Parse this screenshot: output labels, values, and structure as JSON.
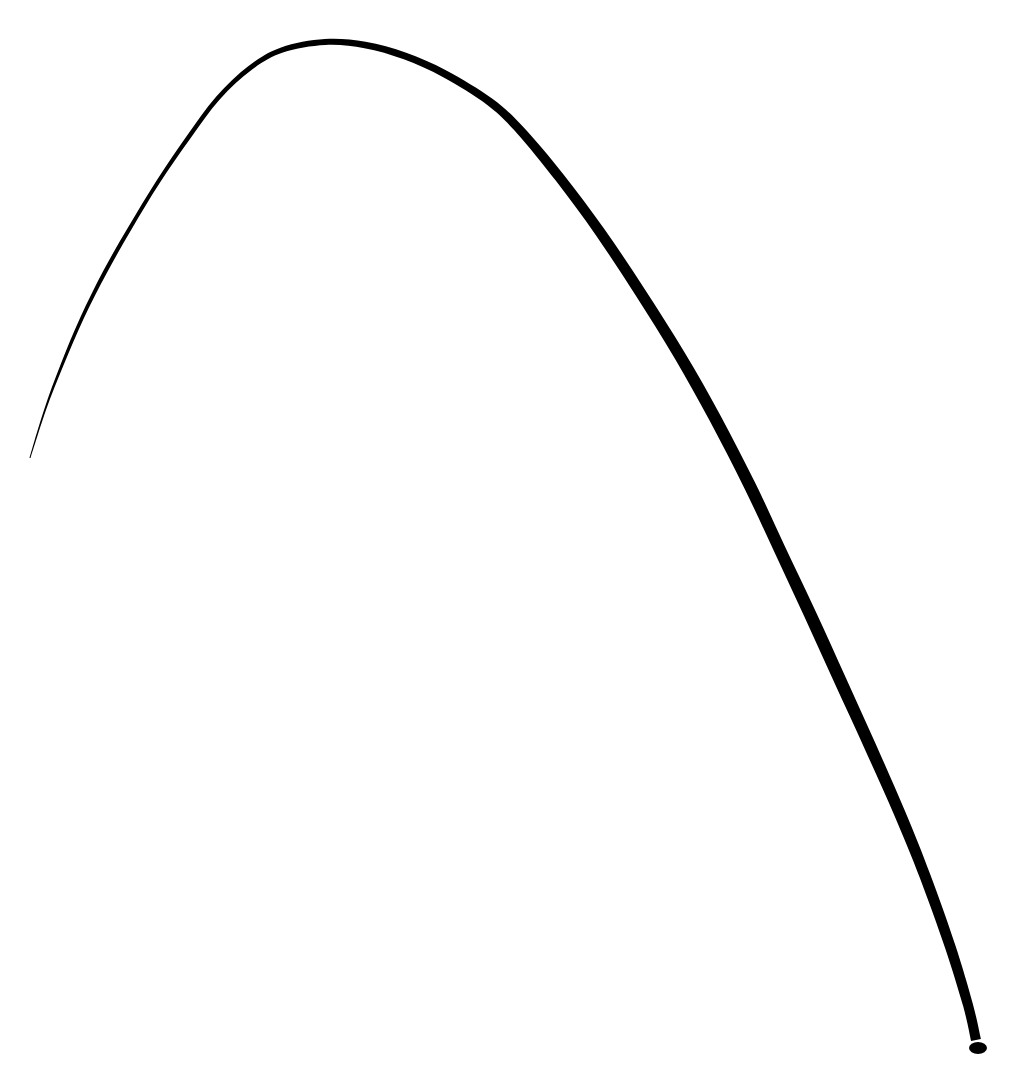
{
  "canvas": {
    "width": 1029,
    "height": 1082,
    "background": "#ffffff"
  },
  "stroke": {
    "description": "hand-drawn ink arc",
    "color": "#000000",
    "centerline": [
      [
        30,
        458
      ],
      [
        45,
        410
      ],
      [
        62,
        365
      ],
      [
        82,
        318
      ],
      [
        105,
        272
      ],
      [
        130,
        228
      ],
      [
        158,
        182
      ],
      [
        188,
        138
      ],
      [
        218,
        98
      ],
      [
        250,
        68
      ],
      [
        282,
        50
      ],
      [
        325,
        42
      ],
      [
        365,
        45
      ],
      [
        405,
        56
      ],
      [
        445,
        74
      ],
      [
        490,
        102
      ],
      [
        520,
        130
      ],
      [
        560,
        178
      ],
      [
        600,
        232
      ],
      [
        640,
        292
      ],
      [
        680,
        356
      ],
      [
        715,
        418
      ],
      [
        750,
        486
      ],
      [
        780,
        550
      ],
      [
        810,
        614
      ],
      [
        840,
        680
      ],
      [
        870,
        746
      ],
      [
        900,
        814
      ],
      [
        925,
        876
      ],
      [
        950,
        946
      ],
      [
        968,
        1005
      ],
      [
        976,
        1040
      ]
    ],
    "widths": [
      1,
      2,
      3,
      3.5,
      4,
      4,
      4,
      4.5,
      4.5,
      5,
      5.5,
      6,
      6.5,
      7,
      7.5,
      8,
      9,
      10,
      10.5,
      11,
      11.5,
      12,
      12,
      12,
      12.5,
      12.5,
      12,
      11.5,
      11,
      10.5,
      10,
      10
    ],
    "end_cap": {
      "cx": 978,
      "cy": 1048,
      "rx": 9,
      "ry": 6
    }
  }
}
